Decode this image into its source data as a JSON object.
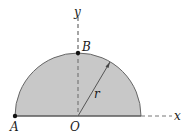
{
  "diagram": {
    "type": "semicircle-geometry",
    "labels": {
      "y_axis": "y",
      "x_axis": "x",
      "point_b": "B",
      "point_a": "A",
      "origin": "O",
      "radius": "r"
    },
    "colors": {
      "fill": "#c8c8c8",
      "stroke": "#555555",
      "axis": "#777777",
      "point": "#111111"
    }
  }
}
